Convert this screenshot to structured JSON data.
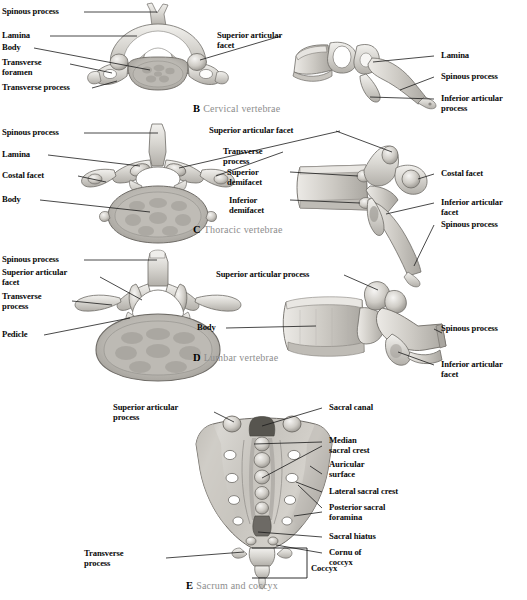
{
  "figure": {
    "background": "#ffffff",
    "label_color": "#0a0a0a",
    "caption_color": "#8d8d8d",
    "leader_color": "#1a1a1a"
  },
  "panels": [
    {
      "key": "cervical",
      "caption_letter": "B",
      "caption_text": "Cervical vertebrae",
      "views": [
        "superior",
        "lateral"
      ],
      "labels_left": [
        {
          "text": "Spinous process"
        },
        {
          "text": "Lamina"
        },
        {
          "text": "Body"
        },
        {
          "text": "Transverse\nforamen"
        },
        {
          "text": "Transverse process"
        }
      ],
      "labels_right": [
        {
          "text": "Superior articular\nfacet"
        },
        {
          "text": "Lamina"
        },
        {
          "text": "Spinous process"
        },
        {
          "text": "Inferior articular\nprocess"
        }
      ]
    },
    {
      "key": "thoracic",
      "caption_letter": "C",
      "caption_text": "Thoracic vertebrae",
      "views": [
        "superior",
        "lateral"
      ],
      "labels_left": [
        {
          "text": "Spinous process"
        },
        {
          "text": "Lamina"
        },
        {
          "text": "Costal facet"
        },
        {
          "text": "Body"
        }
      ],
      "labels_mid": [
        {
          "text": "Superior articular facet"
        },
        {
          "text": "Transverse\nprocess"
        },
        {
          "text": "Superior\ndemifacet"
        },
        {
          "text": "Inferior\ndemifacet"
        }
      ],
      "labels_right": [
        {
          "text": "Costal facet"
        },
        {
          "text": "Inferior articular\nfacet"
        },
        {
          "text": "Spinous process"
        }
      ]
    },
    {
      "key": "lumbar",
      "caption_letter": "D",
      "caption_text": "Lumbar vertebrae",
      "views": [
        "superior",
        "lateral"
      ],
      "labels_left": [
        {
          "text": "Spinous process"
        },
        {
          "text": "Superior articular\nfacet"
        },
        {
          "text": "Transverse\nprocess"
        },
        {
          "text": "Pedicle"
        }
      ],
      "labels_mid": [
        {
          "text": "Superior articular process"
        },
        {
          "text": "Body"
        }
      ],
      "labels_right": [
        {
          "text": "Spinous process"
        },
        {
          "text": "Inferior articular\nfacet"
        }
      ]
    },
    {
      "key": "sacrum",
      "caption_letter": "E",
      "caption_text": "Sacrum and coccyx",
      "views": [
        "posterior"
      ],
      "labels_left": [
        {
          "text": "Superior articular\nprocess"
        },
        {
          "text": "Transverse\nprocess"
        }
      ],
      "labels_right": [
        {
          "text": "Sacral canal"
        },
        {
          "text": "Median\nsacral crest"
        },
        {
          "text": "Auricular\nsurface"
        },
        {
          "text": "Lateral sacral crest"
        },
        {
          "text": "Posterior sacral\nforamina"
        },
        {
          "text": "Sacral hiatus"
        },
        {
          "text": "Cornu of\ncoccyx"
        }
      ],
      "bracket_label": "Coccyx"
    }
  ]
}
